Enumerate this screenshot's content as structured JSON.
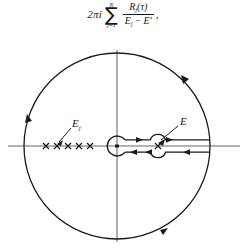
{
  "figure": {
    "title_formula": {
      "coefficient": "2πi",
      "sum_upper": "N",
      "sum_lower": "j=1",
      "sum_symbol": "∑",
      "numerator": "R",
      "numerator_sub": "j",
      "numerator_arg": "(τ)",
      "denominator_left": "E",
      "denominator_left_sub": "j",
      "denominator_minus": "−",
      "denominator_right": "E",
      "denominator_prime": "′",
      "trailing_comma": ","
    },
    "labels": {
      "poles": "E",
      "poles_sub": "j",
      "branch_point": "E"
    },
    "colors": {
      "ink": "#1a1a1a",
      "axis": "#8a8a8a",
      "background": "#ffffff"
    },
    "geometry": {
      "circle_center_x": 117,
      "circle_center_y": 146,
      "circle_radius": 93,
      "real_axis_y": 146,
      "pole_marks_count": 5,
      "pole_marks_x": [
        46,
        57,
        68,
        79,
        90
      ],
      "keyhole_small_circle_x": 117,
      "keyhole_small_circle_r": 10,
      "branch_circle_x": 158,
      "branch_circle_r": 8,
      "cut_end_x": 210,
      "cut_offset": 7
    },
    "arrow_marks": {
      "outer_circle": [
        "upper-right",
        "left",
        "lower-right"
      ],
      "upper_cut": [
        "rightward",
        "rightward"
      ],
      "lower_cut": [
        "leftward",
        "leftward",
        "leftward"
      ]
    }
  }
}
